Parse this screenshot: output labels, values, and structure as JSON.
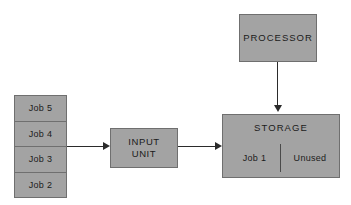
{
  "diagram": {
    "type": "block-flow-diagram",
    "theme": {
      "node_fill": "#a3a3a3",
      "node_border": "#6f6f6f",
      "arrow_color": "#2b2b2b",
      "text_color": "#1b1b1b",
      "background": "#ffffff"
    },
    "job_queue": {
      "name": "job-queue-stack",
      "cells": [
        {
          "label": "Job 5"
        },
        {
          "label": "Job 4"
        },
        {
          "label": "Job 3"
        },
        {
          "label": "Job 2"
        }
      ]
    },
    "input_unit": {
      "name": "input-unit",
      "line1": "INPUT",
      "line2": "UNIT"
    },
    "storage": {
      "name": "storage",
      "title": "STORAGE",
      "partitions": [
        {
          "label": "Job 1"
        },
        {
          "label": "Unused"
        }
      ]
    },
    "processor": {
      "name": "processor",
      "label": "PROCESSOR"
    },
    "arrows": [
      {
        "name": "queue-to-input-arrow",
        "from": "job-queue-stack",
        "to": "input-unit",
        "direction": "right"
      },
      {
        "name": "input-to-storage-arrow",
        "from": "input-unit",
        "to": "storage",
        "direction": "right"
      },
      {
        "name": "processor-to-storage-arrow",
        "from": "processor",
        "to": "storage",
        "direction": "down"
      }
    ]
  }
}
